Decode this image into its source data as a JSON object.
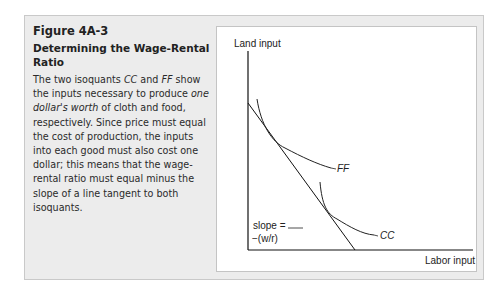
{
  "figure": {
    "number": "Figure 4A-3",
    "title": "Determining the Wage-Rental Ratio",
    "body_parts": [
      {
        "text": "The two isoquants ",
        "italic": false
      },
      {
        "text": "CC",
        "italic": true
      },
      {
        "text": " and ",
        "italic": false
      },
      {
        "text": "FF",
        "italic": true
      },
      {
        "text": " show the inputs necessary to produce ",
        "italic": false
      },
      {
        "text": "one dollar's worth",
        "italic": true
      },
      {
        "text": " of cloth and food, respectively. Since price must equal the cost of production, the inputs into each good must also cost one dollar; this means that the wage-rental ratio must equal minus the slope of a line tangent to both isoquants.",
        "italic": false
      }
    ]
  },
  "chart_data": {
    "type": "line",
    "title": "",
    "xlabel": "Labor input",
    "ylabel": "Land input",
    "grid": false,
    "series": [
      {
        "name": "FF",
        "kind": "isoquant",
        "description": "convex isoquant for food, upper-left, tangent to line"
      },
      {
        "name": "CC",
        "kind": "isoquant",
        "description": "convex isoquant for cloth, lower-right, tangent to line"
      },
      {
        "name": "tangent line",
        "kind": "line",
        "description": "straight line tangent to both isoquants, from y-axis to x-axis"
      }
    ],
    "annotations": [
      {
        "text": "FF",
        "target": "FF isoquant"
      },
      {
        "text": "CC",
        "target": "CC isoquant"
      },
      {
        "text": "slope = −(w/r)",
        "target": "tangent line"
      }
    ]
  },
  "labels": {
    "y_axis": "Land input",
    "x_axis": "Labor input",
    "ff": "FF",
    "cc": "CC",
    "slope_line1": "slope =",
    "slope_line2": "−(w/r)"
  }
}
